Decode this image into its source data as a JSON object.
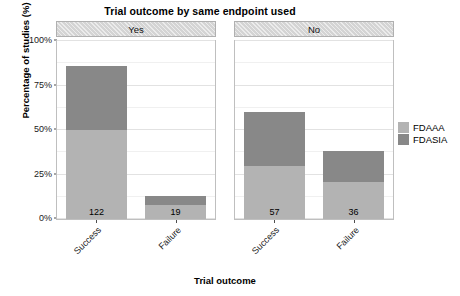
{
  "chart_data": {
    "type": "bar",
    "subtype": "stacked-percent-faceted",
    "title": "Trial outcome by same endpoint used",
    "xlabel": "Trial outcome",
    "ylabel": "Percentage of studies (%)",
    "ylim": [
      0,
      100
    ],
    "yticks": [
      "0%",
      "25%",
      "50%",
      "75%",
      "100%"
    ],
    "ytick_values": [
      0,
      25,
      50,
      75,
      100
    ],
    "grid": true,
    "legend": {
      "position": "right",
      "title": "",
      "entries": [
        {
          "name": "FDAAA",
          "color": "#b3b3b3"
        },
        {
          "name": "FDASIA",
          "color": "#888888"
        }
      ]
    },
    "facet_variable": "same endpoint used",
    "categories": [
      "Success",
      "Failure"
    ],
    "facets": [
      {
        "label": "Yes",
        "bars": [
          {
            "category": "Success",
            "count": "122",
            "segments": [
              {
                "series": "FDAAA",
                "value": 50.0
              },
              {
                "series": "FDASIA",
                "value": 36.0
              }
            ],
            "total": 86.0
          },
          {
            "category": "Failure",
            "count": "19",
            "segments": [
              {
                "series": "FDAAA",
                "value": 8.0
              },
              {
                "series": "FDASIA",
                "value": 5.0
              }
            ],
            "total": 13.0
          }
        ]
      },
      {
        "label": "No",
        "bars": [
          {
            "category": "Success",
            "count": "57",
            "segments": [
              {
                "series": "FDAAA",
                "value": 30.0
              },
              {
                "series": "FDASIA",
                "value": 30.0
              }
            ],
            "total": 60.0
          },
          {
            "category": "Failure",
            "count": "36",
            "segments": [
              {
                "series": "FDAAA",
                "value": 21.0
              },
              {
                "series": "FDASIA",
                "value": 17.0
              }
            ],
            "total": 38.0
          }
        ]
      }
    ]
  },
  "title": "Trial outcome by same endpoint used",
  "axes": {
    "y_title": "Percentage of studies (%)",
    "x_title": "Trial outcome",
    "y_ticks": [
      "100%",
      "75%",
      "50%",
      "25%",
      "0%"
    ]
  },
  "facet_strips": [
    {
      "label": "Yes"
    },
    {
      "label": "No"
    }
  ],
  "x_ticks": [
    "Success",
    "Failure"
  ],
  "legend": {
    "items": [
      {
        "label": "FDAAA"
      },
      {
        "label": "FDASIA"
      }
    ]
  },
  "bar_counts": {
    "yes_success": "122",
    "yes_failure": "19",
    "no_success": "57",
    "no_failure": "36"
  },
  "colors": {
    "fdaaa": "#b3b3b3",
    "fdasia": "#888888",
    "strip": "#d4d4d4",
    "panel_border": "#bfbfbf",
    "gridline": "#e2e2e2"
  }
}
